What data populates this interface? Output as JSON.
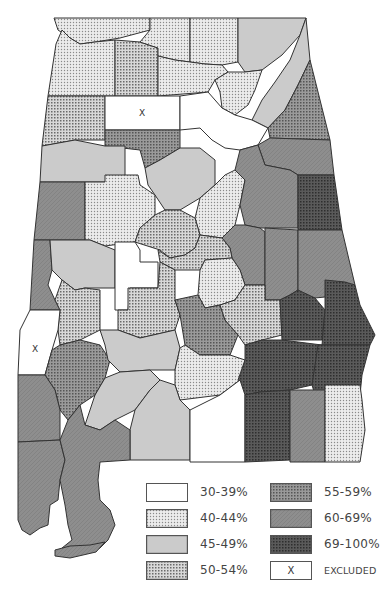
{
  "map": {
    "region": "Alabama counties",
    "legend": [
      {
        "id": "c30",
        "label": "30-39%",
        "fill": "#ffffff",
        "pattern": "none"
      },
      {
        "id": "c40",
        "label": "40-44%",
        "fill": "#e4e4e4",
        "pattern": "fine-dots"
      },
      {
        "id": "c45",
        "label": "45-49%",
        "fill": "#c9c9c9",
        "pattern": "solid-light"
      },
      {
        "id": "c50",
        "label": "50-54%",
        "fill": "#b3b3b3",
        "pattern": "crosshatch"
      },
      {
        "id": "c55",
        "label": "55-59%",
        "fill": "#7f7f7f",
        "pattern": "dense-dots"
      },
      {
        "id": "c60",
        "label": "60-69%",
        "fill": "#8c8c8c",
        "pattern": "solid-medium"
      },
      {
        "id": "c69",
        "label": "69-100%",
        "fill": "#4a4a4a",
        "pattern": "dark-dots"
      },
      {
        "id": "excluded",
        "label": "EXCLUDED",
        "fill": "#ffffff",
        "pattern": "x-mark"
      }
    ],
    "excluded_mark": "X"
  }
}
